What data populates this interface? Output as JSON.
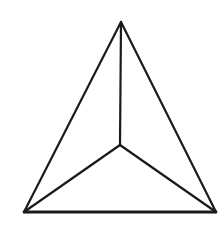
{
  "diagram": {
    "type": "triangular-pyramid-top-view",
    "background": "#ffffff",
    "stroke_color": "#1a1a1a",
    "stroke_width": 2.2,
    "base_stroke_width": 2.8,
    "vertices": {
      "apex": {
        "x": 121,
        "y": 22
      },
      "bottom_left": {
        "x": 24,
        "y": 212
      },
      "bottom_right": {
        "x": 216,
        "y": 212
      },
      "center": {
        "x": 120,
        "y": 145
      }
    },
    "edges": [
      {
        "from": "apex",
        "to": "bottom_left"
      },
      {
        "from": "apex",
        "to": "bottom_right"
      },
      {
        "from": "bottom_left",
        "to": "bottom_right"
      },
      {
        "from": "apex",
        "to": "center"
      },
      {
        "from": "bottom_left",
        "to": "center"
      },
      {
        "from": "bottom_right",
        "to": "center"
      }
    ]
  }
}
